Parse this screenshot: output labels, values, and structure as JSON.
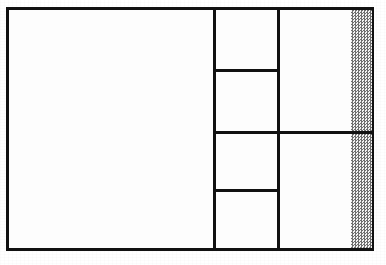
{
  "document": {
    "title": "Floor Plan Diagram",
    "type": "line-drawing",
    "caption": "",
    "background_color": "#ffffff",
    "line_color": "#111111",
    "fill_color": "#fdfdfd",
    "hatch_color": "#6e6e6e",
    "hatch_background": "#f2f2f2"
  },
  "canvas": {
    "width": 386,
    "height": 265
  },
  "outline": {
    "label": "",
    "x": 6,
    "y": 7,
    "width": 368,
    "height": 244,
    "stroke_width": 3
  },
  "regions": [
    {
      "name": "large-left-room",
      "label": "",
      "x": 9,
      "y": 10,
      "width": 204,
      "height": 238
    },
    {
      "name": "upper-middle-small-room",
      "label": "",
      "x": 216,
      "y": 10,
      "width": 61,
      "height": 61
    },
    {
      "name": "upper-middle-lower-room",
      "label": "",
      "x": 216,
      "y": 74,
      "width": 61,
      "height": 59
    },
    {
      "name": "upper-right-room",
      "label": "",
      "x": 280,
      "y": 10,
      "width": 71,
      "height": 123
    },
    {
      "name": "lower-middle-upper-room",
      "label": "",
      "x": 216,
      "y": 136,
      "width": 61,
      "height": 55
    },
    {
      "name": "lower-middle-small-room",
      "label": "",
      "x": 216,
      "y": 194,
      "width": 61,
      "height": 54
    },
    {
      "name": "lower-right-room",
      "label": "",
      "x": 280,
      "y": 136,
      "width": 71,
      "height": 112
    }
  ],
  "walls": [
    {
      "name": "vertical-wall-main-divider",
      "label": "",
      "orientation": "vertical",
      "x": 213,
      "y": 7,
      "length": 244
    },
    {
      "name": "vertical-wall-secondary-divider",
      "label": "",
      "orientation": "vertical",
      "x": 277,
      "y": 7,
      "length": 244
    },
    {
      "name": "horizontal-wall-upper-box-bottom",
      "label": "",
      "orientation": "horizontal",
      "x": 213,
      "y": 69,
      "length": 67
    },
    {
      "name": "horizontal-wall-center-full-span",
      "label": "",
      "orientation": "horizontal",
      "x": 213,
      "y": 131,
      "length": 161
    },
    {
      "name": "horizontal-wall-lower-box-top",
      "label": "",
      "orientation": "horizontal",
      "x": 213,
      "y": 189,
      "length": 67
    }
  ],
  "hatched_areas": [
    {
      "name": "hatch-strip-upper",
      "label": "",
      "description": "stippled vertical strip, upper segment",
      "x": 351,
      "y": 10,
      "width": 21,
      "height": 121
    },
    {
      "name": "hatch-strip-lower",
      "label": "",
      "description": "stippled vertical strip, lower segment",
      "x": 351,
      "y": 134,
      "width": 21,
      "height": 114
    }
  ]
}
